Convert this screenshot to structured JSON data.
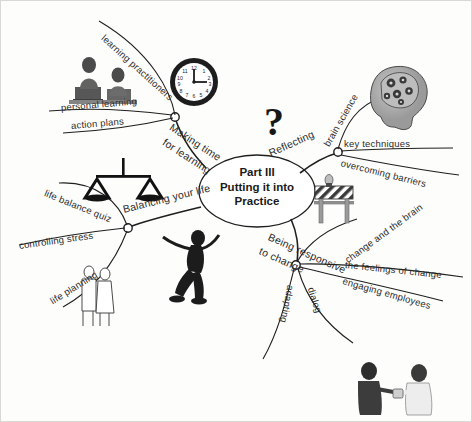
{
  "map": {
    "title": "Part III\nPutting it into\nPractice",
    "center_label": "Part III Putting it into Practice",
    "question_mark": "?",
    "colors": {
      "ink": "#2b2b2b",
      "paper": "#fdfdfc",
      "border": "#d8d8d4"
    }
  },
  "branches": [
    {
      "id": "making-time-for-learning",
      "label": "Making time\nfor learning",
      "label_line1": "Making time",
      "label_line2": "for learning",
      "children": [
        {
          "id": "learning-practitioners",
          "label": "learning practitioners"
        },
        {
          "id": "personal-learning",
          "label": "personal learning"
        },
        {
          "id": "action-plans",
          "label": "action plans"
        }
      ],
      "images": [
        {
          "id": "people-at-computers",
          "name": "people-at-computers-illustration"
        },
        {
          "id": "wall-clock",
          "name": "wall-clock-illustration",
          "time": "3:00"
        }
      ]
    },
    {
      "id": "reflecting",
      "label": "Reflecting",
      "children": [
        {
          "id": "brain-science",
          "label": "brain science"
        },
        {
          "id": "key-techniques",
          "label": "key techniques"
        },
        {
          "id": "overcoming-barriers",
          "label": "overcoming barriers"
        }
      ],
      "images": [
        {
          "id": "head-with-gears",
          "name": "head-with-gears-illustration"
        },
        {
          "id": "road-barrier",
          "name": "road-barrier-illustration"
        }
      ]
    },
    {
      "id": "being-responsive-to-change",
      "label": "Being responsive\nto change",
      "label_line1": "Being responsive",
      "label_line2": "to change",
      "children": [
        {
          "id": "change-and-the-brain",
          "label": "change and the brain"
        },
        {
          "id": "the-feelings-of-change",
          "label": "the feelings of change"
        },
        {
          "id": "engaging-employees",
          "label": "engaging employees"
        },
        {
          "id": "dialog",
          "label": "dialog"
        },
        {
          "id": "adapting",
          "label": "adapting"
        }
      ],
      "images": [
        {
          "id": "two-people-talking",
          "name": "two-people-talking-illustration"
        }
      ]
    },
    {
      "id": "balancing-your-life",
      "label": "Balancing your life",
      "children": [
        {
          "id": "life-balance-quiz",
          "label": "life balance quiz"
        },
        {
          "id": "controlling-stress",
          "label": "controlling stress"
        },
        {
          "id": "life-planning",
          "label": "life planning"
        }
      ],
      "images": [
        {
          "id": "balance-scales",
          "name": "balance-scales-icon"
        },
        {
          "id": "couple-walking",
          "name": "couple-walking-illustration"
        },
        {
          "id": "running-figure",
          "name": "running-figure-illustration"
        }
      ]
    }
  ]
}
